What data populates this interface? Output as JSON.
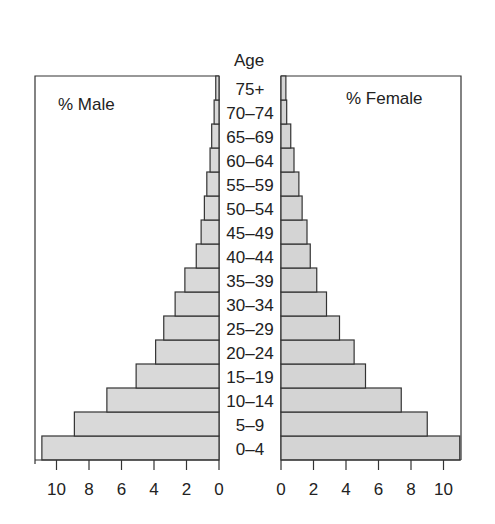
{
  "chart_data": {
    "type": "bar",
    "subtype": "population-pyramid",
    "title": "",
    "center_axis_label": "Age",
    "categories": [
      "0–4",
      "5–9",
      "10–14",
      "15–19",
      "20–24",
      "25–29",
      "30–34",
      "35–39",
      "40–44",
      "45–49",
      "50–54",
      "55–59",
      "60–64",
      "65–69",
      "70–74",
      "75+"
    ],
    "series": [
      {
        "name": "% Male",
        "side": "left",
        "color": "#d9d9d9",
        "values": [
          10.9,
          8.9,
          6.9,
          5.1,
          3.9,
          3.4,
          2.7,
          2.1,
          1.4,
          1.1,
          0.9,
          0.75,
          0.55,
          0.45,
          0.3,
          0.2
        ]
      },
      {
        "name": "% Female",
        "side": "right",
        "color": "#d4d4d4",
        "values": [
          11.0,
          9.0,
          7.4,
          5.2,
          4.5,
          3.6,
          2.8,
          2.2,
          1.8,
          1.6,
          1.3,
          1.1,
          0.8,
          0.6,
          0.35,
          0.3
        ]
      }
    ],
    "left_panel_label": "% Male",
    "right_panel_label": "% Female",
    "x_ticks_left": [
      10,
      8,
      6,
      4,
      2,
      0
    ],
    "x_ticks_right": [
      0,
      2,
      4,
      6,
      8,
      10
    ],
    "xlim": [
      0,
      11
    ],
    "grid": false,
    "legend": "panel labels inside plot boxes"
  }
}
